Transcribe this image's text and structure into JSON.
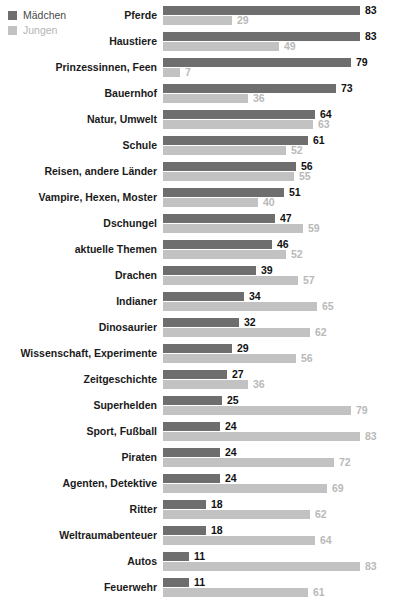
{
  "legend": {
    "items": [
      {
        "label": "Mädchen",
        "color": "#6e6e6e",
        "key": "girls"
      },
      {
        "label": "Jungen",
        "color": "#c2c2c2",
        "key": "boys"
      }
    ]
  },
  "chart_data": {
    "type": "bar",
    "orientation": "horizontal",
    "title": "",
    "subtitle": "",
    "xlabel": "",
    "ylabel": "",
    "xlim": [
      0,
      83
    ],
    "grid": false,
    "legend_position": "top-left",
    "categories": [
      "Pferde",
      "Haustiere",
      "Prinzessinnen, Feen",
      "Bauernhof",
      "Natur, Umwelt",
      "Schule",
      "Reisen, andere Länder",
      "Vampire, Hexen, Moster",
      "Dschungel",
      "aktuelle Themen",
      "Drachen",
      "Indianer",
      "Dinosaurier",
      "Wissenschaft, Experimente",
      "Zeitgeschichte",
      "Superhelden",
      "Sport, Fußball",
      "Piraten",
      "Agenten, Detektive",
      "Ritter",
      "Weltraumabenteuer",
      "Autos",
      "Feuerwehr"
    ],
    "series": [
      {
        "name": "Mädchen",
        "color": "#6e6e6e",
        "values": [
          83,
          83,
          79,
          73,
          64,
          61,
          56,
          51,
          47,
          46,
          39,
          34,
          32,
          29,
          27,
          25,
          24,
          24,
          24,
          18,
          18,
          11,
          11
        ]
      },
      {
        "name": "Jungen",
        "color": "#c2c2c2",
        "values": [
          29,
          49,
          7,
          36,
          63,
          52,
          55,
          40,
          59,
          52,
          57,
          65,
          62,
          56,
          36,
          79,
          83,
          72,
          69,
          62,
          64,
          83,
          61
        ]
      }
    ]
  }
}
